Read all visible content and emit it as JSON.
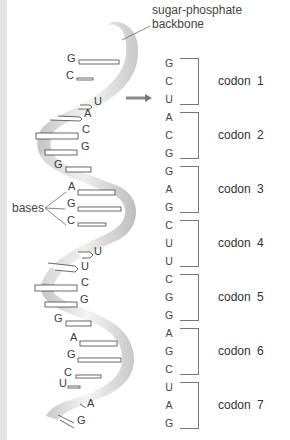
{
  "labels": {
    "backbone_line1": "sugar-phosphate",
    "backbone_line2": "backbone",
    "bases": "bases"
  },
  "colors": {
    "ribbon_light": "#f2f2f2",
    "ribbon_dark": "#b8b8b8",
    "edge_strip": "#e4e4e4",
    "bracket": "#777777",
    "arrow": "#8a8a8a"
  },
  "helix_bases": [
    {
      "letter": "G",
      "x": 67,
      "y": 58
    },
    {
      "letter": "C",
      "x": 66,
      "y": 75
    },
    {
      "letter": "U",
      "x": 94,
      "y": 101
    },
    {
      "letter": "A",
      "x": 84,
      "y": 113
    },
    {
      "letter": "C",
      "x": 82,
      "y": 129
    },
    {
      "letter": "G",
      "x": 81,
      "y": 146
    },
    {
      "letter": "G",
      "x": 54,
      "y": 164
    },
    {
      "letter": "A",
      "x": 68,
      "y": 186
    },
    {
      "letter": "G",
      "x": 67,
      "y": 203
    },
    {
      "letter": "C",
      "x": 67,
      "y": 220
    },
    {
      "letter": "U",
      "x": 94,
      "y": 251
    },
    {
      "letter": "U",
      "x": 81,
      "y": 266
    },
    {
      "letter": "C",
      "x": 81,
      "y": 282
    },
    {
      "letter": "G",
      "x": 80,
      "y": 299
    },
    {
      "letter": "G",
      "x": 54,
      "y": 318
    },
    {
      "letter": "A",
      "x": 70,
      "y": 337
    },
    {
      "letter": "G",
      "x": 67,
      "y": 354
    },
    {
      "letter": "C",
      "x": 64,
      "y": 372
    },
    {
      "letter": "U",
      "x": 59,
      "y": 383
    },
    {
      "letter": "A",
      "x": 87,
      "y": 403
    },
    {
      "letter": "G",
      "x": 77,
      "y": 420
    }
  ],
  "codons": [
    {
      "label": "codon  1",
      "bases": [
        "G",
        "C",
        "U"
      ]
    },
    {
      "label": "codon  2",
      "bases": [
        "A",
        "C",
        "G"
      ]
    },
    {
      "label": "codon  3",
      "bases": [
        "G",
        "A",
        "G"
      ]
    },
    {
      "label": "codon  4",
      "bases": [
        "C",
        "U",
        "U"
      ]
    },
    {
      "label": "codon  5",
      "bases": [
        "C",
        "G",
        "G"
      ]
    },
    {
      "label": "codon  6",
      "bases": [
        "A",
        "G",
        "C"
      ]
    },
    {
      "label": "codon 7",
      "bases": [
        "U",
        "A",
        "G"
      ]
    }
  ]
}
